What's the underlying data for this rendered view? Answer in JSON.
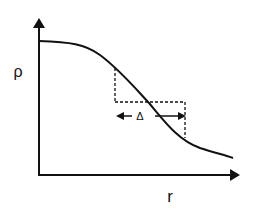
{
  "diagram": {
    "y_axis_label": "ρ",
    "x_axis_label": "r",
    "delta_label": "Δ",
    "curve": {
      "description": "decreasing sigmoid-like density profile ρ(r)",
      "points": [
        [
          39,
          41
        ],
        [
          60,
          42
        ],
        [
          80,
          45
        ],
        [
          95,
          52
        ],
        [
          110,
          63
        ],
        [
          125,
          78
        ],
        [
          140,
          94
        ],
        [
          149,
          103
        ],
        [
          160,
          116
        ],
        [
          172,
          130
        ],
        [
          185,
          141
        ],
        [
          200,
          148
        ],
        [
          218,
          153
        ],
        [
          233,
          157
        ]
      ],
      "color": "#111111"
    },
    "box": {
      "left_x": 115,
      "right_x": 185,
      "mid_y": 102,
      "top_y": 68,
      "bottom_y": 138,
      "style": "dashed"
    },
    "delta_arrow": {
      "y": 116,
      "x1": 116,
      "x2": 185
    }
  }
}
